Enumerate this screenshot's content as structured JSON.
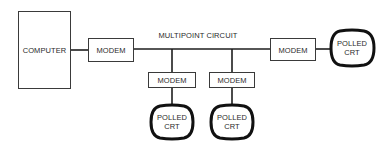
{
  "diagram": {
    "circuit_label": "MULTIPOINT CIRCUIT",
    "nodes": {
      "computer": {
        "label": "COMPUTER"
      },
      "modem_host": {
        "label": "MODEM"
      },
      "modem_drop_1": {
        "label": "MODEM"
      },
      "modem_drop_2": {
        "label": "MODEM"
      },
      "modem_end": {
        "label": "MODEM"
      },
      "crt_drop_1": {
        "line1": "POLLED",
        "line2": "CRT"
      },
      "crt_drop_2": {
        "line1": "POLLED",
        "line2": "CRT"
      },
      "crt_end": {
        "line1": "POLLED",
        "line2": "CRT"
      }
    }
  }
}
